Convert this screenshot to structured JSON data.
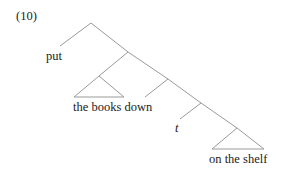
{
  "example_number": "(10)",
  "tree": {
    "leaves": {
      "verb": "put",
      "object": "the books down",
      "trace": "t",
      "pp": "on the shelf"
    }
  },
  "colors": {
    "lines": "#9a9a9a",
    "text": "#222222",
    "background": "#ffffff"
  }
}
